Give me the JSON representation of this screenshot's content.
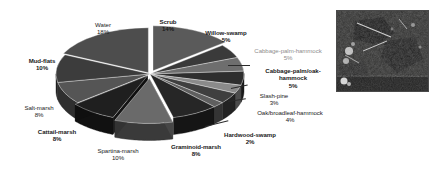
{
  "figure": {
    "type": "pie-chart-figure",
    "has_inset_image": true,
    "inset_image_name": "aerial-satellite-thumbnail"
  },
  "chart_data": {
    "type": "pie",
    "title": "",
    "subtitle": "",
    "xlabel": "",
    "ylabel": "",
    "exploded": true,
    "three_d": true,
    "legend_position": "none",
    "labels_outside": true,
    "value_unit": "%",
    "categories": [
      "Scrub",
      "Willow-swamp",
      "Cabbage-palm-hammock",
      "Cabbage-palm/oak-hammock",
      "Slash-pine",
      "Oak/broadleaf-hammock",
      "Hardwood-swamp",
      "Graminoid-marsh",
      "Spartina-marsh",
      "Cattail-marsh",
      "Salt-marsh",
      "Mud-flats",
      "Water"
    ],
    "values": [
      14,
      5,
      5,
      5,
      3,
      4,
      2,
      8,
      10,
      8,
      8,
      10,
      18
    ],
    "colors": [
      "#5a5a5a",
      "#3a3a3a",
      "#6e6e6e",
      "#2e2e2e",
      "#8a8a8a",
      "#3f3f3f",
      "#5f5f5f",
      "#262626",
      "#6a6a6a",
      "#1f1f1f",
      "#555555",
      "#3c3c3c",
      "#4d4d4d"
    ]
  },
  "labels": [
    {
      "name": "water",
      "text": "Water",
      "pct": "18%",
      "bold": false,
      "grey": false
    },
    {
      "name": "scrub",
      "text": "Scrub",
      "pct": "14%",
      "bold": true,
      "grey": false
    },
    {
      "name": "willow-swamp",
      "text": "Willow-swamp",
      "pct": "5%",
      "bold": true,
      "grey": false
    },
    {
      "name": "cabbage-palm-hammock",
      "text": "Cabbage-palm-hammock",
      "pct": "5%",
      "bold": false,
      "grey": true
    },
    {
      "name": "cabbage-palm-oak-hammock",
      "text": "Cabbage-palm/oak-\nhammock",
      "pct": "5%",
      "bold": true,
      "grey": false
    },
    {
      "name": "slash-pine",
      "text": "Slash-pine",
      "pct": "3%",
      "bold": false,
      "grey": false
    },
    {
      "name": "oak-broadleaf-hammock",
      "text": "Oak/broadleaf-hammock",
      "pct": "4%",
      "bold": false,
      "grey": false
    },
    {
      "name": "hardwood-swamp",
      "text": "Hardwood-swamp",
      "pct": "2%",
      "bold": true,
      "grey": false
    },
    {
      "name": "graminoid-marsh",
      "text": "Graminoid-marsh",
      "pct": "8%",
      "bold": true,
      "grey": false
    },
    {
      "name": "spartina-marsh",
      "text": "Spartina-marsh",
      "pct": "10%",
      "bold": false,
      "grey": false
    },
    {
      "name": "cattail-marsh",
      "text": "Cattail-marsh",
      "pct": "8%",
      "bold": true,
      "grey": false
    },
    {
      "name": "salt-marsh",
      "text": "Salt-marsh",
      "pct": "8%",
      "bold": false,
      "grey": false
    },
    {
      "name": "mud-flats",
      "text": "Mud-flats",
      "pct": "10%",
      "bold": true,
      "grey": false
    }
  ]
}
